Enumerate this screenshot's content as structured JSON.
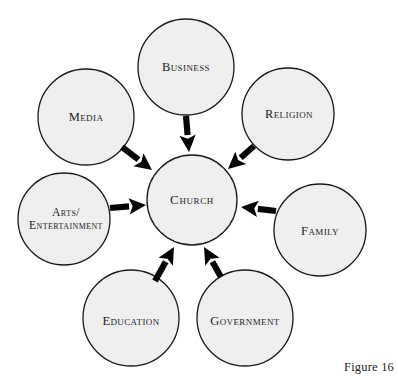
{
  "figure": {
    "caption": "Figure 16",
    "caption_x": 344,
    "caption_y": 360,
    "width": 398,
    "height": 382,
    "background": "#ffffff"
  },
  "style": {
    "circle_fill": "#efefef",
    "circle_stroke": "#1a1a1a",
    "circle_stroke_width": 1.3,
    "arrow_color": "#050505",
    "text_color": "#1d1d1d"
  },
  "diagram": {
    "type": "radial-hub-and-spoke",
    "center": {
      "id": "church",
      "label": "Church",
      "cx": 192,
      "cy": 200,
      "r": 45,
      "label_size": "size-center"
    },
    "nodes": [
      {
        "id": "business",
        "label": "Business",
        "cx": 186,
        "cy": 67,
        "r": 48,
        "label_x": 186,
        "label_y": 67,
        "label_size": "size-md"
      },
      {
        "id": "religion",
        "label": "Religion",
        "cx": 288,
        "cy": 114,
        "r": 46,
        "label_x": 289,
        "label_y": 114,
        "label_size": "size-md"
      },
      {
        "id": "family",
        "label": "Family",
        "cx": 320,
        "cy": 230,
        "r": 46,
        "label_x": 320,
        "label_y": 231,
        "label_size": "size-md"
      },
      {
        "id": "government",
        "label": "Government",
        "cx": 245,
        "cy": 318,
        "r": 48,
        "label_x": 245,
        "label_y": 321,
        "label_size": "size-md"
      },
      {
        "id": "education",
        "label": "Education",
        "cx": 131,
        "cy": 318,
        "r": 48,
        "label_x": 131,
        "label_y": 321,
        "label_size": "size-md"
      },
      {
        "id": "arts",
        "label": "Arts/ Entertainment",
        "cx": 64,
        "cy": 219,
        "r": 46,
        "label_x": 66,
        "label_y": 219,
        "label_size": "size-sm",
        "label_lines": [
          "Arts/",
          "Entertainment"
        ]
      },
      {
        "id": "media",
        "label": "Media",
        "cx": 86,
        "cy": 117,
        "r": 48,
        "label_x": 86,
        "label_y": 117,
        "label_size": "size-md"
      }
    ],
    "arrows": [
      {
        "id": "arrow-business-to-church",
        "from": "business",
        "to": "church",
        "x1": 186,
        "y1": 116,
        "x2": 189,
        "y2": 152,
        "direction": "down"
      },
      {
        "id": "arrow-religion-to-church",
        "from": "religion",
        "to": "church",
        "x1": 254,
        "y1": 146,
        "x2": 228,
        "y2": 169,
        "direction": "down-left"
      },
      {
        "id": "arrow-family-to-church",
        "from": "family",
        "to": "church",
        "x1": 276,
        "y1": 211,
        "x2": 241,
        "y2": 207,
        "direction": "left"
      },
      {
        "id": "arrow-government-to-church",
        "from": "government",
        "to": "church",
        "x1": 221,
        "y1": 277,
        "x2": 204,
        "y2": 247,
        "direction": "up-left"
      },
      {
        "id": "arrow-education-to-church",
        "from": "education",
        "to": "church",
        "x1": 155,
        "y1": 281,
        "x2": 174,
        "y2": 247,
        "direction": "up-right"
      },
      {
        "id": "arrow-arts-to-church",
        "from": "arts",
        "to": "church",
        "x1": 110,
        "y1": 208,
        "x2": 146,
        "y2": 205,
        "direction": "right"
      },
      {
        "id": "arrow-media-to-church",
        "from": "media",
        "to": "church",
        "x1": 122,
        "y1": 147,
        "x2": 152,
        "y2": 170,
        "direction": "down-right"
      }
    ]
  }
}
